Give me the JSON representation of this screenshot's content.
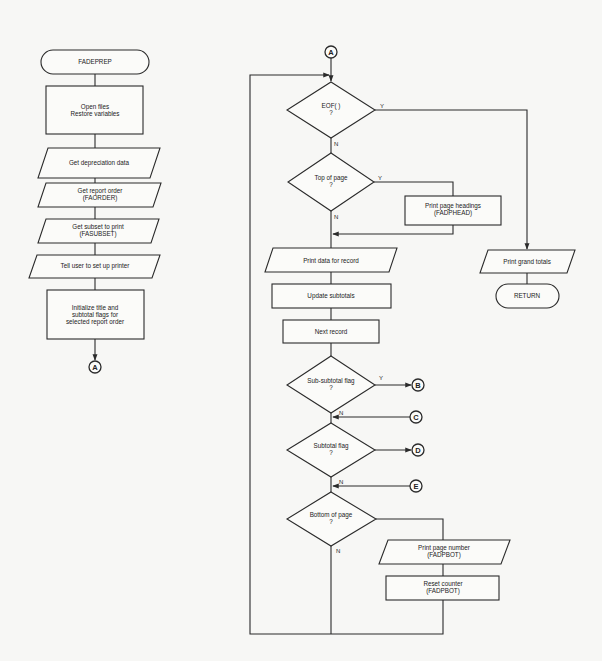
{
  "left_flow": {
    "start": "FADEPREP",
    "open_files": [
      "Open files",
      "Restore variables"
    ],
    "get_depreciation": "Get depreciation data",
    "get_report_order": [
      "Get report order",
      "(FAORDER)"
    ],
    "get_subset": [
      "Get subset to print",
      "(FASUBSET)"
    ],
    "tell_user": "Tell user to set up printer",
    "initialize": [
      "Initialize title and",
      "subtotal flags for",
      "selected report order"
    ],
    "connector_out": "A"
  },
  "right_flow": {
    "connector_in": "A",
    "eof_decision": [
      "EOF( )",
      "?"
    ],
    "top_of_page_decision": [
      "Top of page",
      "?"
    ],
    "print_headings": [
      "Print page headings",
      "(FADPHEAD)"
    ],
    "print_data": "Print data for record",
    "update_subtotals": "Update subtotals",
    "next_record": "Next record",
    "sub_subtotal_decision": [
      "Sub-subtotal flag",
      "?"
    ],
    "subtotal_decision": [
      "Subtotal flag",
      "?"
    ],
    "bottom_of_page_decision": [
      "Bottom of page",
      "?"
    ],
    "print_page_number": [
      "Print page number",
      "(FADPBOT)"
    ],
    "reset_counter": [
      "Reset counter",
      "(FADPBOT)"
    ],
    "print_grand_totals": "Print grand totals",
    "return": "RETURN"
  },
  "branch_labels": {
    "yes": "Y",
    "no": "N"
  },
  "connectors": {
    "b": "B",
    "c": "C",
    "d": "D",
    "e": "E"
  }
}
